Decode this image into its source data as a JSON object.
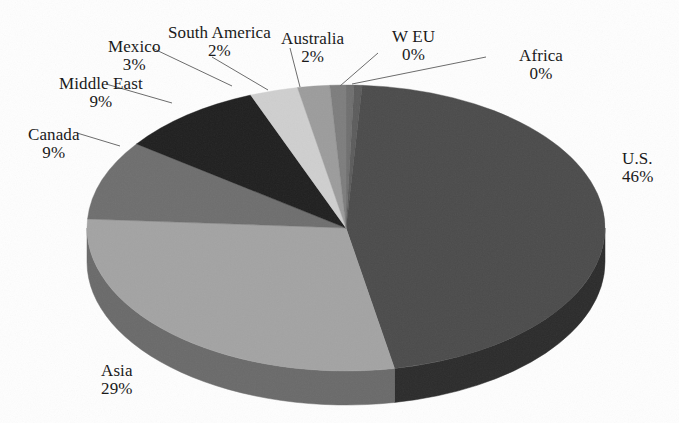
{
  "chart_data": {
    "type": "pie",
    "title": "",
    "subtitle": "",
    "xlabel": "",
    "ylabel": "",
    "legend_position": "none",
    "grid": false,
    "labels_show_percent": true,
    "three_d": true,
    "categories": [
      "W EU",
      "Africa",
      "U.S.",
      "Asia",
      "Canada",
      "Middle East",
      "Mexico",
      "South America",
      "Australia"
    ],
    "values": [
      0,
      0,
      46,
      29,
      9,
      9,
      3,
      2,
      2
    ],
    "slices": [
      {
        "name": "W EU",
        "percent_text": "0%",
        "value": 0,
        "color": "#6f6f6f",
        "side_color": "#4f4f4f",
        "start_deg": 0,
        "sweep_deg": 1.8,
        "label_name": "W EU",
        "label_pct": "0%"
      },
      {
        "name": "Africa",
        "percent_text": "0%",
        "value": 0,
        "color": "#5c5c5c",
        "side_color": "#3e3e3e",
        "start_deg": 1.8,
        "sweep_deg": 1.8,
        "label_name": "Africa",
        "label_pct": "0%"
      },
      {
        "name": "U.S.",
        "percent_text": "46%",
        "value": 46,
        "color": "#4b4b4b",
        "side_color": "#2b2b2b",
        "start_deg": 3.6,
        "sweep_deg": 165.6,
        "label_name": "U.S.",
        "label_pct": "46%"
      },
      {
        "name": "Asia",
        "percent_text": "29%",
        "value": 29,
        "color": "#a3a3a3",
        "side_color": "#6a6a6a",
        "start_deg": 169.2,
        "sweep_deg": 104.4,
        "label_name": "Asia",
        "label_pct": "29%"
      },
      {
        "name": "Canada",
        "percent_text": "9%",
        "value": 9,
        "color": "#6e6e6e",
        "side_color": "#4a4a4a",
        "start_deg": 273.6,
        "sweep_deg": 32.4,
        "label_name": "Canada",
        "label_pct": "9%"
      },
      {
        "name": "Middle East",
        "percent_text": "9%",
        "value": 9,
        "color": "#1f1f1f",
        "side_color": "#141414",
        "start_deg": 306.0,
        "sweep_deg": 32.4,
        "label_name": "Middle East",
        "label_pct": "9%"
      },
      {
        "name": "Mexico",
        "percent_text": "3%",
        "value": 3,
        "color": "#cfcfcf",
        "side_color": "#9a9a9a",
        "start_deg": 338.4,
        "sweep_deg": 10.8,
        "label_name": "Mexico",
        "label_pct": "3%"
      },
      {
        "name": "South America",
        "percent_text": "2%",
        "value": 2,
        "color": "#9c9c9c",
        "side_color": "#6d6d6d",
        "start_deg": 349.2,
        "sweep_deg": 7.2,
        "label_name": "South America",
        "label_pct": "2%"
      },
      {
        "name": "Australia",
        "percent_text": "2%",
        "value": 2,
        "color": "#7d7d7d",
        "side_color": "#575757",
        "start_deg": 356.4,
        "sweep_deg": 3.6,
        "label_name": "Australia",
        "label_pct": "2%"
      }
    ],
    "geometry": {
      "center_x": 346,
      "center_y": 228,
      "radius_x": 259,
      "radius_y": 143,
      "depth": 34
    },
    "label_positions": [
      {
        "name": "Mexico",
        "x": 108,
        "y": 38,
        "align": "center"
      },
      {
        "name": "South America",
        "x": 168,
        "y": 24,
        "align": "center"
      },
      {
        "name": "Australia",
        "x": 281,
        "y": 30,
        "align": "center"
      },
      {
        "name": "W EU",
        "x": 392,
        "y": 28,
        "align": "center"
      },
      {
        "name": "Africa",
        "x": 519,
        "y": 47,
        "align": "center"
      },
      {
        "name": "Middle East",
        "x": 59,
        "y": 75,
        "align": "center"
      },
      {
        "name": "Canada",
        "x": 28,
        "y": 126,
        "align": "center"
      },
      {
        "name": "U.S.",
        "x": 622,
        "y": 150,
        "align": "left"
      },
      {
        "name": "Asia",
        "x": 101,
        "y": 362,
        "align": "center"
      }
    ],
    "leader_lines": [
      {
        "name": "Mexico",
        "x1": 152,
        "y1": 48,
        "x2": 232,
        "y2": 86
      },
      {
        "name": "South America",
        "x1": 212,
        "y1": 57,
        "x2": 268,
        "y2": 90
      },
      {
        "name": "Australia",
        "x1": 290,
        "y1": 48,
        "x2": 300,
        "y2": 87
      },
      {
        "name": "W EU",
        "x1": 378,
        "y1": 53,
        "x2": 340,
        "y2": 86
      },
      {
        "name": "Africa",
        "x1": 486,
        "y1": 57,
        "x2": 352,
        "y2": 84
      },
      {
        "name": "Middle East",
        "x1": 106,
        "y1": 84,
        "x2": 172,
        "y2": 103
      },
      {
        "name": "Canada",
        "x1": 77,
        "y1": 133,
        "x2": 120,
        "y2": 146
      }
    ]
  }
}
